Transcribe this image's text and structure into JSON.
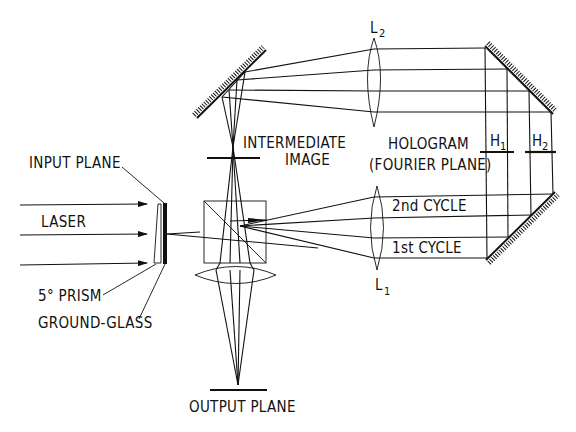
{
  "diagram": {
    "type": "optical setup schematic",
    "labels": {
      "input_plane": "INPUT PLANE",
      "laser": "LASER",
      "prism": "5° PRISM",
      "ground_glass": "GROUND-GLASS",
      "intermediate_line1": "INTERMEDIATE",
      "intermediate_line2": "IMAGE",
      "hologram_line1": "HOLOGRAM",
      "hologram_line2": "(FOURIER PLANE)",
      "cycle2": "2nd CYCLE",
      "cycle1": "1st CYCLE",
      "output_plane": "OUTPUT PLANE",
      "lens2_main": "L",
      "lens2_sub": "2",
      "lens1_main": "L",
      "lens1_sub": "1",
      "h1_main": "H",
      "h1_sub": "1",
      "h2_main": "H",
      "h2_sub": "2"
    },
    "components": [
      "laser-beams",
      "5-degree-prism",
      "ground-glass-input-plane",
      "beam-splitter-cube",
      "imaging-lens",
      "output-plane",
      "intermediate-image-plane",
      "upper-left-mirror",
      "lens-L2",
      "lens-L1",
      "upper-right-mirror",
      "lower-right-mirror",
      "hologram-H1",
      "hologram-H2"
    ]
  }
}
